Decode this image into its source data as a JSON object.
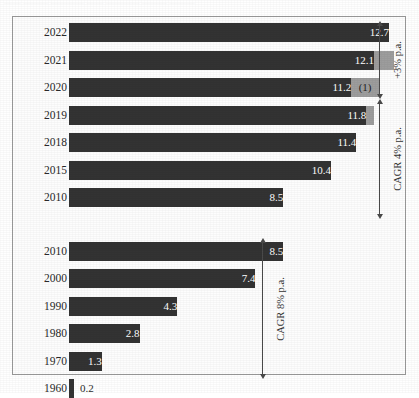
{
  "clipped_header": "—— ——— ———— —— ————  ——— ———",
  "chart_data": {
    "type": "bar",
    "title": "",
    "xlabel": "",
    "ylabel": "",
    "orientation": "horizontal",
    "grid": false,
    "legend": null,
    "xlim": [
      0,
      13.5
    ],
    "panels": [
      {
        "name": "recent-years-panel",
        "categories": [
          "2022",
          "2021",
          "2020",
          "2019",
          "2018",
          "2015",
          "2010"
        ],
        "values": [
          12.7,
          12.1,
          11.2,
          11.8,
          11.4,
          10.4,
          8.5
        ],
        "value_labels": [
          "12.7",
          "12.1",
          "11.2",
          "11.8",
          "11.4",
          "10.4",
          "8.5"
        ],
        "extension_values": [
          12.7,
          12.9,
          12.3,
          12.1,
          11.4,
          10.4,
          8.5
        ],
        "footnote_marks": [
          "",
          "",
          "(1)",
          "",
          "",
          "",
          ""
        ],
        "annotations": [
          {
            "name": "plus-3-arrow",
            "label": "+3% p.a.",
            "from": "2020",
            "to": "2022"
          },
          {
            "name": "cagr-4-arrow",
            "label": "CAGR 4% p.a.",
            "from": "2010",
            "to": "2019"
          }
        ]
      },
      {
        "name": "historic-decades-panel",
        "categories": [
          "2010",
          "2000",
          "1990",
          "1980",
          "1970",
          "1960"
        ],
        "values": [
          8.5,
          7.4,
          4.3,
          2.8,
          1.3,
          0.2
        ],
        "value_labels": [
          "8.5",
          "7.4",
          "4.3",
          "2.8",
          "1.3",
          "0.2"
        ],
        "annotations": [
          {
            "name": "cagr-8-arrow",
            "label": "CAGR 8% p.a.",
            "from": "1960",
            "to": "2010"
          }
        ]
      }
    ],
    "colors": {
      "bar": "#333333",
      "bar_extension": "#9d9d9d",
      "value_text": "#ffffff",
      "value_text_outside": "#2c2c2c",
      "frame": "#9a9a9a",
      "background": "#fdfdfd"
    }
  }
}
